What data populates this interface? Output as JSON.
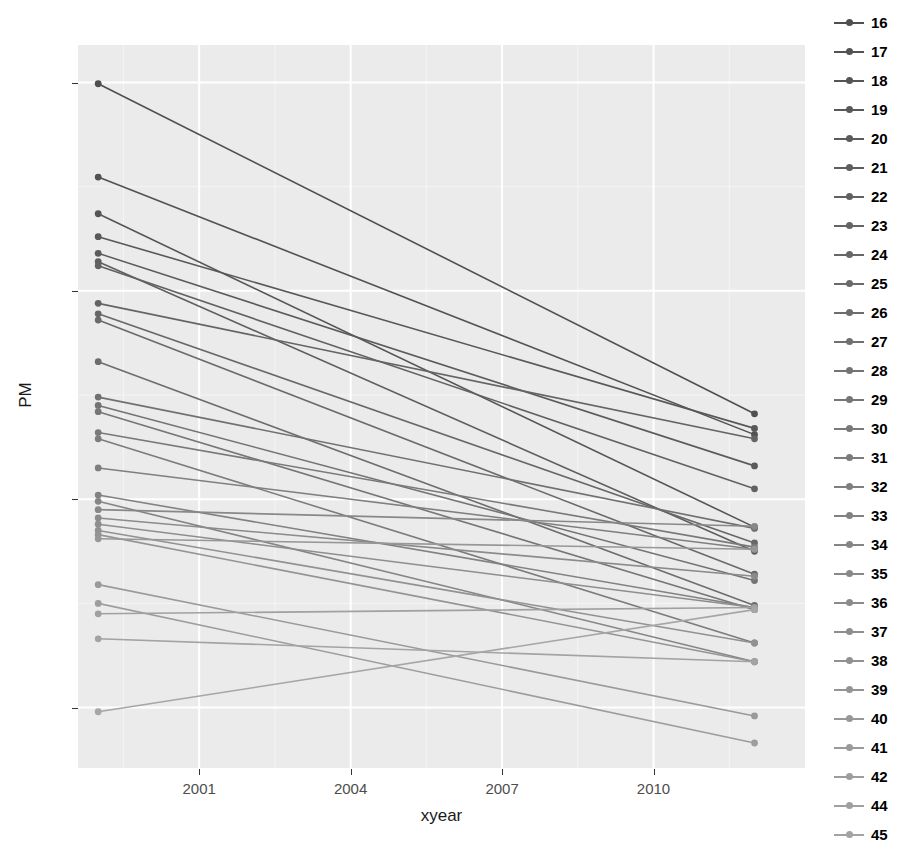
{
  "chart_data": {
    "type": "line",
    "title": "",
    "xlabel": "xyear",
    "ylabel": "PM",
    "xlim": [
      1998.6,
      2013.0
    ],
    "ylim": [
      3.55,
      20.9
    ],
    "xticks": [
      2001,
      2004,
      2007,
      2010
    ],
    "yticks": [
      5,
      10,
      15,
      20
    ],
    "grid": true,
    "legend_position": "right",
    "legend_title": "",
    "x": [
      1999,
      2012
    ],
    "series": [
      {
        "name": "16",
        "values": [
          19.97,
          12.05
        ],
        "color": "#4f4f4f"
      },
      {
        "name": "17",
        "values": [
          17.73,
          11.55
        ],
        "color": "#525252"
      },
      {
        "name": "18",
        "values": [
          16.85,
          9.33
        ],
        "color": "#555555"
      },
      {
        "name": "19",
        "values": [
          16.3,
          11.7
        ],
        "color": "#585858"
      },
      {
        "name": "20",
        "values": [
          15.9,
          10.8
        ],
        "color": "#5b5b5b"
      },
      {
        "name": "21",
        "values": [
          15.7,
          8.75
        ],
        "color": "#5e5e5e"
      },
      {
        "name": "22",
        "values": [
          15.6,
          10.25
        ],
        "color": "#616161"
      },
      {
        "name": "23",
        "values": [
          14.7,
          11.45
        ],
        "color": "#646464"
      },
      {
        "name": "24",
        "values": [
          14.45,
          8.95
        ],
        "color": "#676767"
      },
      {
        "name": "25",
        "values": [
          14.3,
          8.2
        ],
        "color": "#6a6a6a"
      },
      {
        "name": "26",
        "values": [
          13.3,
          7.45
        ],
        "color": "#6d6d6d"
      },
      {
        "name": "27",
        "values": [
          12.45,
          9.3
        ],
        "color": "#707070"
      },
      {
        "name": "28",
        "values": [
          12.25,
          8.05
        ],
        "color": "#737373"
      },
      {
        "name": "29",
        "values": [
          12.1,
          7.35
        ],
        "color": "#767676"
      },
      {
        "name": "30",
        "values": [
          11.6,
          8.85
        ],
        "color": "#797979"
      },
      {
        "name": "31",
        "values": [
          11.45,
          6.55
        ],
        "color": "#7c7c7c"
      },
      {
        "name": "32",
        "values": [
          10.75,
          8.8
        ],
        "color": "#7f7f7f"
      },
      {
        "name": "33",
        "values": [
          10.1,
          7.4
        ],
        "color": "#828282"
      },
      {
        "name": "34",
        "values": [
          9.95,
          6.1
        ],
        "color": "#858585"
      },
      {
        "name": "35",
        "values": [
          9.75,
          9.35
        ],
        "color": "#888888"
      },
      {
        "name": "36",
        "values": [
          9.55,
          8.15
        ],
        "color": "#8b8b8b"
      },
      {
        "name": "37",
        "values": [
          9.4,
          7.4
        ],
        "color": "#8e8e8e"
      },
      {
        "name": "38",
        "values": [
          9.25,
          6.55
        ],
        "color": "#919191"
      },
      {
        "name": "39",
        "values": [
          9.15,
          6.1
        ],
        "color": "#949494"
      },
      {
        "name": "40",
        "values": [
          9.05,
          8.8
        ],
        "color": "#979797"
      },
      {
        "name": "41",
        "values": [
          7.95,
          4.8
        ],
        "color": "#9a9a9a"
      },
      {
        "name": "42",
        "values": [
          7.5,
          4.15
        ],
        "color": "#9d9d9d"
      },
      {
        "name": "44",
        "values": [
          7.25,
          7.4
        ],
        "color": "#a0a0a0"
      },
      {
        "name": "45",
        "values": [
          6.65,
          6.1
        ],
        "color": "#a3a3a3"
      },
      {
        "name": "46",
        "values": [
          4.9,
          7.35
        ],
        "color": "#a6a6a6"
      }
    ],
    "legend_entries": [
      "16",
      "17",
      "18",
      "19",
      "20",
      "21",
      "22",
      "23",
      "24",
      "25",
      "26",
      "27",
      "28",
      "29",
      "30",
      "31",
      "32",
      "33",
      "34",
      "35",
      "36",
      "37",
      "38",
      "39",
      "40",
      "41",
      "42",
      "44",
      "45",
      "46"
    ]
  },
  "style": {
    "panel_background": "#ebebeb",
    "grid_major": "#ffffff",
    "grid_minor": "#f5f5f5",
    "axis_text": "#4d4d4d",
    "axis_title": "#1a1a1a",
    "page_background": "#ffffff"
  }
}
